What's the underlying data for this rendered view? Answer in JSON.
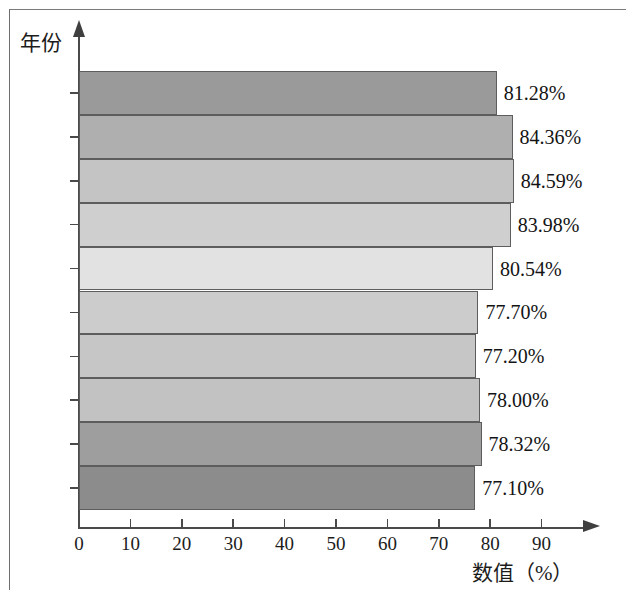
{
  "chart_data": {
    "type": "bar",
    "orientation": "horizontal",
    "title": "",
    "subtitle": "",
    "xlabel": "数值（%）",
    "ylabel": "年份",
    "categories": [
      "2020",
      "2019",
      "2018",
      "2017",
      "2016",
      "2015",
      "2014",
      "2013",
      "2012",
      "2011"
    ],
    "values": [
      81.28,
      84.36,
      84.59,
      83.98,
      80.54,
      77.7,
      77.2,
      78.0,
      78.32,
      77.1
    ],
    "value_labels": [
      "81.28%",
      "84.36%",
      "84.59%",
      "83.98%",
      "80.54%",
      "77.70%",
      "77.20%",
      "78.00%",
      "78.32%",
      "77.10%"
    ],
    "bar_colors": [
      "#9a9a9a",
      "#afafaf",
      "#c4c4c4",
      "#cfcfcf",
      "#e2e2e2",
      "#cccccc",
      "#c6c6c6",
      "#c2c2c2",
      "#9e9e9e",
      "#8c8c8c"
    ],
    "xlim": [
      0,
      95
    ],
    "x_ticks": [
      0,
      10,
      20,
      30,
      40,
      50,
      60,
      70,
      80,
      90
    ],
    "x_tick_labels": [
      "0",
      "10",
      "20",
      "30",
      "40",
      "50",
      "60",
      "70",
      "80",
      "90"
    ],
    "grid": false,
    "legend": null,
    "axis_color": "#4a4a4a",
    "bar_border_color": "#5d5d5d",
    "text_color": "#1c1c1c"
  }
}
